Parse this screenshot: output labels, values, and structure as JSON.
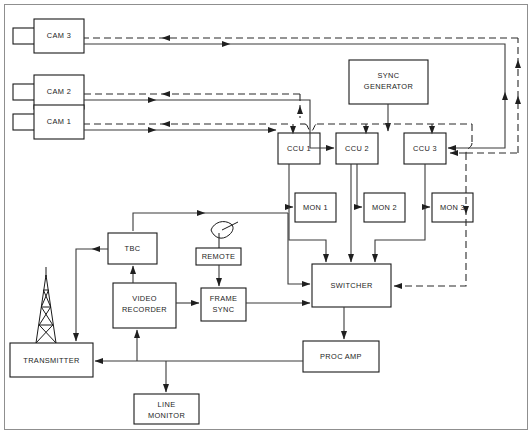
{
  "diagram": {
    "colors": {
      "line": "#3a3a3a",
      "dashed": "#2b2b2b",
      "box_stroke": "#1a1a1a",
      "background": "#ffffff"
    },
    "line_legend": {
      "solid": "video signal path",
      "dashed": "sync / return control path"
    },
    "nodes": [
      {
        "id": "cam3",
        "label": "CAM 3",
        "type": "camera"
      },
      {
        "id": "cam2",
        "label": "CAM 2",
        "type": "camera"
      },
      {
        "id": "cam1",
        "label": "CAM 1",
        "type": "camera"
      },
      {
        "id": "syncgen",
        "label_line1": "SYNC",
        "label_line2": "GENERATOR",
        "type": "box"
      },
      {
        "id": "ccu1",
        "label": "CCU 1",
        "type": "box"
      },
      {
        "id": "ccu2",
        "label": "CCU 2",
        "type": "box"
      },
      {
        "id": "ccu3",
        "label": "CCU 3",
        "type": "box"
      },
      {
        "id": "mon1",
        "label": "MON 1",
        "type": "box"
      },
      {
        "id": "mon2",
        "label": "MON 2",
        "type": "box"
      },
      {
        "id": "mon3",
        "label": "MON 3",
        "type": "box"
      },
      {
        "id": "tbc",
        "label": "TBC",
        "type": "box"
      },
      {
        "id": "remote",
        "label": "REMOTE",
        "type": "box"
      },
      {
        "id": "videorec",
        "label_line1": "VIDEO",
        "label_line2": "RECORDER",
        "type": "box"
      },
      {
        "id": "framesync",
        "label_line1": "FRAME",
        "label_line2": "SYNC",
        "type": "box"
      },
      {
        "id": "switcher",
        "label": "SWITCHER",
        "type": "box"
      },
      {
        "id": "transmitter",
        "label": "TRANSMITTER",
        "type": "box"
      },
      {
        "id": "procamp",
        "label": "PROC AMP",
        "type": "box"
      },
      {
        "id": "linemonitor",
        "label_line1": "LINE",
        "label_line2": "MONITOR",
        "type": "box"
      }
    ],
    "icons": [
      {
        "id": "tower",
        "name": "transmitter-tower-icon",
        "attached_to": "transmitter"
      },
      {
        "id": "dish",
        "name": "satellite-dish-icon",
        "attached_to": "remote"
      }
    ]
  }
}
